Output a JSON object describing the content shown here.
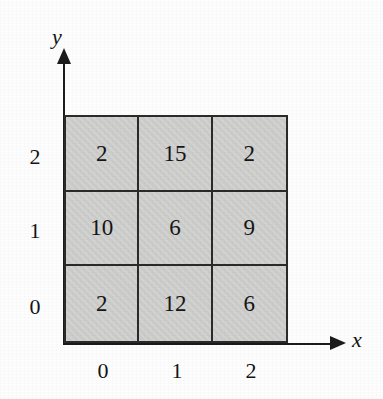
{
  "figure": {
    "background_color": "#fdfdfd",
    "cell_fill_color": "#cececd",
    "line_color": "#2a2a2a",
    "text_color": "#151515"
  },
  "axes": {
    "x_label": "x",
    "y_label": "y",
    "x_tick_labels": [
      "0",
      "1",
      "2"
    ],
    "y_tick_labels": [
      "2",
      "1",
      "0"
    ]
  },
  "chart_data": {
    "type": "heatmap",
    "title": "",
    "xlabel": "x",
    "ylabel": "y",
    "x": [
      0,
      1,
      2
    ],
    "y": [
      0,
      1,
      2
    ],
    "xticklabels": [
      "0",
      "1",
      "2"
    ],
    "yticklabels": [
      "0",
      "1",
      "2"
    ],
    "grid": true,
    "legend": "none",
    "cell_labels_shown": true,
    "rows_top_to_bottom": [
      {
        "y": 2,
        "values": [
          2,
          15,
          2
        ]
      },
      {
        "y": 1,
        "values": [
          10,
          6,
          9
        ]
      },
      {
        "y": 0,
        "values": [
          2,
          12,
          6
        ]
      }
    ],
    "values": [
      [
        2,
        12,
        6
      ],
      [
        10,
        6,
        9
      ],
      [
        2,
        15,
        2
      ]
    ],
    "cells": [
      {
        "x": 0,
        "y": 2,
        "value": "2"
      },
      {
        "x": 1,
        "y": 2,
        "value": "15"
      },
      {
        "x": 2,
        "y": 2,
        "value": "2"
      },
      {
        "x": 0,
        "y": 1,
        "value": "10"
      },
      {
        "x": 1,
        "y": 1,
        "value": "6"
      },
      {
        "x": 2,
        "y": 1,
        "value": "9"
      },
      {
        "x": 0,
        "y": 0,
        "value": "2"
      },
      {
        "x": 1,
        "y": 0,
        "value": "12"
      },
      {
        "x": 2,
        "y": 0,
        "value": "6"
      }
    ]
  }
}
